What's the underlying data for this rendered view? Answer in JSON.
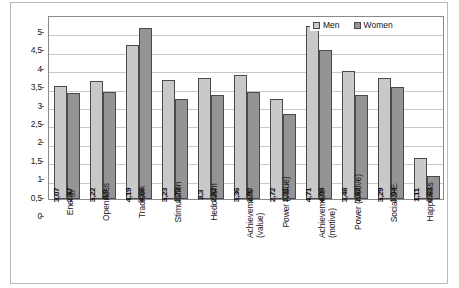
{
  "chart_data": {
    "type": "bar",
    "title": "",
    "xlabel": "",
    "ylabel": "",
    "ylim": [
      0,
      5
    ],
    "ytick_step": 0.5,
    "grid": true,
    "decimal_separator": ",",
    "legend_position": "top-right",
    "categories": [
      "Energy",
      "Openness",
      "Tradison",
      "Stimulation",
      "Hedonism",
      "Achievement (value)",
      "Power (value)",
      "Achievement (motive)",
      "Power (motive)",
      "Social S.E.",
      "Happiness"
    ],
    "category_lines": [
      [
        "Energy"
      ],
      [
        "Openness"
      ],
      [
        "Tradison"
      ],
      [
        "Stimulation"
      ],
      [
        "Hedonism"
      ],
      [
        "Achievement",
        "(value)"
      ],
      [
        "Power (value)"
      ],
      [
        "Achievement",
        "(motive)"
      ],
      [
        "Power (motive)"
      ],
      [
        "Social S.E."
      ],
      [
        "Happiness"
      ]
    ],
    "series": [
      {
        "name": "Men",
        "color": "#c9c9c9",
        "values": [
          3.07,
          3.22,
          4.19,
          3.23,
          3.3,
          3.36,
          2.72,
          4.71,
          3.48,
          3.29,
          1.11
        ],
        "labels": [
          "3,07",
          "3,22",
          "4,19",
          "3,23",
          "3,3",
          "3,36",
          "2,72",
          "4,71",
          "3,48",
          "3,29",
          "1,11"
        ]
      },
      {
        "name": "Women",
        "color": "#949494",
        "values": [
          2.87,
          2.9,
          4.66,
          2.73,
          2.82,
          2.92,
          2.31,
          4.04,
          2.82,
          3.04,
          0.63
        ],
        "labels": [
          "2,87",
          "2,9",
          "4,66",
          "2,73",
          "2,82",
          "2,92",
          "2,31",
          "4,04",
          "2,82",
          "3,04",
          "0,63"
        ]
      }
    ],
    "ytick_labels": [
      "0",
      "0,5",
      "1",
      "1,5",
      "2",
      "2,5",
      "3",
      "3,5",
      "4",
      "4,5",
      "5"
    ],
    "ytick_values": [
      0,
      0.5,
      1,
      1.5,
      2,
      2.5,
      3,
      3.5,
      4,
      4.5,
      5
    ]
  },
  "legend": {
    "items": [
      {
        "label": "Men",
        "color": "#c9c9c9"
      },
      {
        "label": "Women",
        "color": "#949494"
      }
    ]
  },
  "caption": ""
}
